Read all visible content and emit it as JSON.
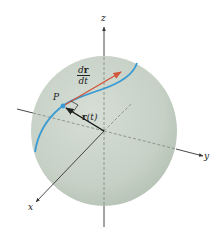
{
  "figure": {
    "colors": {
      "sphere_fill": "#c9d3c8",
      "sphere_shade": "#b3c0b3",
      "curve": "#3a9bd4",
      "tangent_vector": "#d0553a",
      "position_vector": "#111111",
      "axes": "#333333"
    }
  },
  "labels": {
    "z_axis": "z",
    "y_axis": "y",
    "x_axis": "x",
    "point": "P",
    "position_vector": "r(t)",
    "position_vector_bold": "r",
    "position_vector_arg": "(t)",
    "tangent_numerator_d": "d",
    "tangent_numerator_r": "r",
    "tangent_denominator": "dt"
  }
}
